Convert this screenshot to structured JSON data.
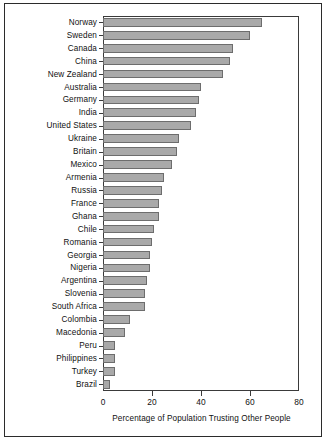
{
  "chart_data": {
    "type": "bar",
    "orientation": "horizontal",
    "title": "",
    "xlabel": "Percentage of Population Trusting Other People",
    "ylabel": "",
    "xlim": [
      0,
      80
    ],
    "xticks": [
      0,
      20,
      40,
      60,
      80
    ],
    "grid": false,
    "legend": null,
    "categories": [
      "Norway",
      "Sweden",
      "Canada",
      "China",
      "New Zealand",
      "Australia",
      "Germany",
      "India",
      "United States",
      "Ukraine",
      "Britain",
      "Mexico",
      "Armenia",
      "Russia",
      "France",
      "Ghana",
      "Chile",
      "Romania",
      "Georgia",
      "Nigeria",
      "Argentina",
      "Slovenia",
      "South Africa",
      "Colombia",
      "Macedonia",
      "Peru",
      "Philippines",
      "Turkey",
      "Brazil"
    ],
    "values": [
      65,
      60,
      53,
      52,
      49,
      40,
      39,
      38,
      36,
      31,
      30,
      28,
      25,
      24,
      23,
      23,
      21,
      20,
      19,
      19,
      18,
      17,
      17,
      11,
      9,
      5,
      5,
      5,
      3
    ],
    "bar_color": "#a9a9a9",
    "bar_edge_color": "#6d6d6d",
    "axis_color": "#3a3a3a"
  },
  "xaxis": {
    "title": "Percentage of Population Trusting Other People",
    "ticks": [
      {
        "label": "0",
        "value": 0
      },
      {
        "label": "20",
        "value": 20
      },
      {
        "label": "40",
        "value": 40
      },
      {
        "label": "60",
        "value": 60
      },
      {
        "label": "80",
        "value": 80
      }
    ]
  }
}
